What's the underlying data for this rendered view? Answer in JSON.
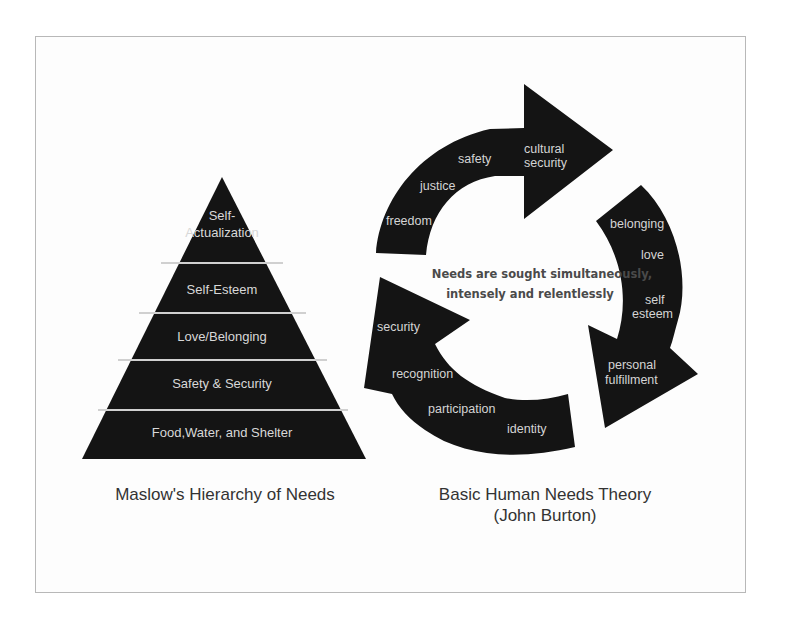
{
  "maslow": {
    "caption": "Maslow's Hierarchy of Needs",
    "levels": [
      {
        "line1": "Self-",
        "line2": "Actualization"
      },
      {
        "label": "Self-Esteem"
      },
      {
        "label": "Love/Belonging"
      },
      {
        "label": "Safety & Security"
      },
      {
        "label": "Food,Water, and Shelter"
      }
    ]
  },
  "burton": {
    "caption_line1": "Basic Human Needs Theory",
    "caption_line2": "(John Burton)",
    "center_line1": "Needs are sought simultaneously,",
    "center_line2": "intensely and relentlessly",
    "top_arrow": [
      "freedom",
      "justice",
      "safety",
      "cultural",
      "security"
    ],
    "right_arrow": [
      "belonging",
      "love",
      "self",
      "esteem",
      "personal",
      "fulfillment"
    ],
    "bottom_arrow": [
      "security",
      "recognition",
      "participation",
      "identity"
    ]
  },
  "colors": {
    "shape_fill": "#141414",
    "divider": "#d0d0d0",
    "frame_border": "#b8b8b8"
  }
}
